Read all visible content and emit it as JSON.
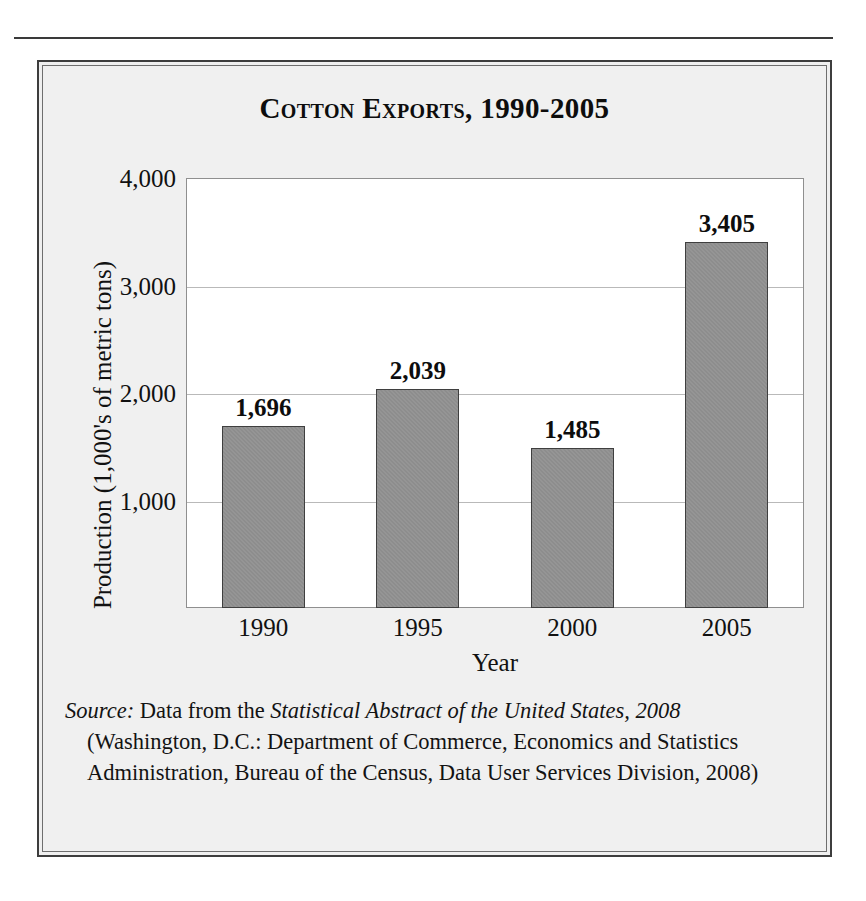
{
  "figure": {
    "title": "Cotton Exports, 1990-2005",
    "source_note": {
      "lead": "Source:",
      "text_before_work": " Data from the ",
      "work": "Statistical Abstract of the United States, 2008",
      "text_after_work": " (Washington, D.C.: Department of Commerce, Economics and Statistics Administration, Bureau of the Census, Data User Services Division, 2008)"
    }
  },
  "chart_data": {
    "type": "bar",
    "title": "Cotton Exports, 1990-2005",
    "categories": [
      "1990",
      "1995",
      "2000",
      "2005"
    ],
    "values": [
      1696,
      2039,
      1485,
      3405
    ],
    "value_labels": [
      "1,696",
      "2,039",
      "1,485",
      "3,405"
    ],
    "xlabel": "Year",
    "ylabel": "Production (1,000's of metric tons)",
    "ylim": [
      0,
      4000
    ],
    "yticks": [
      1000,
      2000,
      3000,
      4000
    ],
    "ytick_labels": [
      "1,000",
      "2,000",
      "3,000",
      "4,000"
    ],
    "grid": true,
    "legend": null,
    "bar_color": "#8d8d8d",
    "bar_border_color": "#3f3f3f",
    "plot_background": "#ffffff",
    "panel_background": "#f0f0f0"
  }
}
